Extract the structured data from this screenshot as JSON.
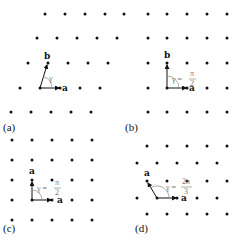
{
  "figure": {
    "panels": [
      {
        "id": "a",
        "label": "(a)",
        "lattice": "oblique",
        "vector1": "a",
        "vector2": "b",
        "angle_label": "γ",
        "angle_num": "",
        "angle_den": ""
      },
      {
        "id": "b",
        "label": "(b)",
        "lattice": "rectangular",
        "vector1": "a",
        "vector2": "b",
        "angle_label": "γ =",
        "angle_num": "π",
        "angle_den": "2"
      },
      {
        "id": "c",
        "label": "(c)",
        "lattice": "square",
        "vector1": "a",
        "vector2": "a",
        "angle_label": "γ =",
        "angle_num": "π",
        "angle_den": "2"
      },
      {
        "id": "d",
        "label": "(d)",
        "lattice": "hexagonal",
        "vector1": "a",
        "vector2": "a",
        "angle_label": "γ =",
        "angle_num": "2π",
        "angle_den": "3"
      }
    ]
  },
  "colors": {
    "dot": "#111111",
    "vector": "#111111",
    "angle_arc": "#888888",
    "angle_text": "#777777"
  }
}
